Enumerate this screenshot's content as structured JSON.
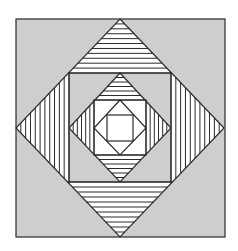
{
  "canvas": {
    "width": 238,
    "height": 251,
    "background": "#ffffff"
  },
  "colors": {
    "gray": "#cecece",
    "stroke": "#2a2a2a",
    "white": "#ffffff"
  },
  "outer_square": {
    "x1": 16,
    "y1": 19,
    "x2": 225,
    "y2": 237
  },
  "big_diamond": {
    "top": [
      120,
      19
    ],
    "left": [
      16,
      128
    ],
    "right": [
      224,
      128
    ],
    "bottom": [
      120,
      237
    ]
  },
  "big_inner_square": {
    "x1": 69,
    "y1": 73,
    "x2": 171,
    "y2": 182
  },
  "mid_diamond": {
    "top": [
      120,
      73
    ],
    "left": [
      69,
      128
    ],
    "right": [
      171,
      128
    ],
    "bottom": [
      120,
      182
    ]
  },
  "mid_inner_square": {
    "x1": 94,
    "y1": 100,
    "x2": 146,
    "y2": 155
  },
  "small_diamond": {
    "top": [
      120,
      100
    ],
    "left": [
      94,
      128
    ],
    "right": [
      146,
      128
    ],
    "bottom": [
      120,
      155
    ]
  },
  "core_square": {
    "x1": 107,
    "y1": 115,
    "x2": 133,
    "y2": 141
  },
  "stripes": {
    "big_count": 11,
    "mid_count": 6
  }
}
